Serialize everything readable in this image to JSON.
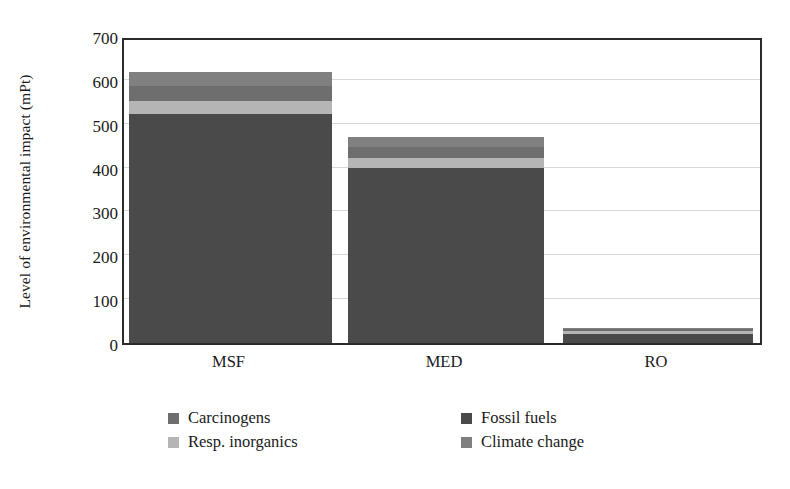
{
  "chart_data": {
    "type": "bar",
    "subtype": "stacked-bar",
    "title": "",
    "xlabel": "",
    "ylabel": "Level of environmental impact (mPt)",
    "categories": [
      "MSF",
      "MED",
      "RO"
    ],
    "ylim": [
      0,
      700
    ],
    "yticks": [
      0,
      100,
      200,
      300,
      400,
      500,
      600,
      700
    ],
    "ytick_labels": [
      "0",
      "100",
      "200",
      "300",
      "400",
      "500",
      "600",
      "700"
    ],
    "grid": "horizontal",
    "legend_position": "bottom",
    "series": [
      {
        "name": "Fossil fuels",
        "color": "#4a4a4a",
        "values": [
          522,
          400,
          20
        ]
      },
      {
        "name": "Resp. inorganics",
        "color": "#b5b5b5",
        "values": [
          30,
          22,
          8
        ]
      },
      {
        "name": "Carcinogens",
        "color": "#6e6e6e",
        "values": [
          34,
          26,
          4
        ]
      },
      {
        "name": "Climate change",
        "color": "#808080",
        "values": [
          32,
          22,
          3
        ]
      }
    ],
    "totals": [
      618,
      470,
      35
    ],
    "legend_order": [
      "Carcinogens",
      "Fossil fuels",
      "Resp. inorganics",
      "Climate change"
    ]
  },
  "colors": {
    "fossil_fuels": "#4a4a4a",
    "resp_inorganics": "#b5b5b5",
    "carcinogens": "#6e6e6e",
    "climate_change": "#808080",
    "axis": "#2b2b2b",
    "gridline": "#d8d8d8",
    "background": "#ffffff"
  }
}
